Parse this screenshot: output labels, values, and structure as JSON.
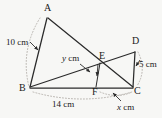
{
  "figure": {
    "background_color": "#f7f7f5",
    "stroke_color": "#2b2b2b",
    "guide_color": "#b9b5b0",
    "vertices": [
      {
        "id": "A",
        "label": "A",
        "x": 47,
        "y": 14
      },
      {
        "id": "B",
        "label": "B",
        "x": 30,
        "y": 88
      },
      {
        "id": "C",
        "label": "C",
        "x": 133,
        "y": 88
      },
      {
        "id": "D",
        "label": "D",
        "x": 135,
        "y": 48
      },
      {
        "id": "E",
        "label": "E",
        "x": 100,
        "y": 62
      },
      {
        "id": "F",
        "label": "F",
        "x": 96,
        "y": 88
      }
    ],
    "segments": [
      {
        "id": "AB",
        "from": "A",
        "to": "B"
      },
      {
        "id": "AC",
        "from": "A",
        "to": "C"
      },
      {
        "id": "BD",
        "from": "B",
        "to": "D"
      },
      {
        "id": "DC",
        "from": "D",
        "to": "C"
      },
      {
        "id": "BC",
        "from": "B",
        "to": "C"
      },
      {
        "id": "EF",
        "from": "E",
        "to": "F"
      }
    ],
    "measures": [
      {
        "id": "AB-length",
        "text": "10 cm",
        "value": 10,
        "unit": "cm",
        "applies_to": "AB",
        "x": 6,
        "y": 42
      },
      {
        "id": "DC-length",
        "text": "5 cm",
        "value": 5,
        "unit": "cm",
        "applies_to": "DC",
        "x": 139,
        "y": 64
      },
      {
        "id": "BC-length",
        "text": "14 cm",
        "value": 14,
        "unit": "cm",
        "applies_to": "BC",
        "x": 52,
        "y": 104
      },
      {
        "id": "EF-length",
        "variable": "y",
        "suffix": " cm",
        "applies_to": "EF",
        "x": 62,
        "y": 58
      },
      {
        "id": "FC-length",
        "variable": "x",
        "suffix": " cm",
        "applies_to": "FC",
        "x": 117,
        "y": 107
      }
    ]
  }
}
